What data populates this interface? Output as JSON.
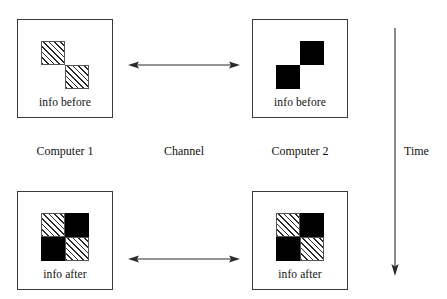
{
  "diagram": {
    "background_color": "#ffffff",
    "line_color": "#3a3a3a",
    "solid_fill_color": "#000000",
    "hatch_fill_color": "#2b2b2b"
  },
  "boxes": [
    {
      "id": "top-left",
      "caption": "info before",
      "cells": {
        "tl": "hatch",
        "tr": "empty",
        "bl": "empty",
        "br": "hatch"
      }
    },
    {
      "id": "top-right",
      "caption": "info before",
      "cells": {
        "tl": "empty",
        "tr": "solid",
        "bl": "solid",
        "br": "empty"
      }
    },
    {
      "id": "bottom-left",
      "caption": "info after",
      "cells": {
        "tl": "hatch",
        "tr": "solid",
        "bl": "solid",
        "br": "hatch"
      }
    },
    {
      "id": "bottom-right",
      "caption": "info after",
      "cells": {
        "tl": "hatch",
        "tr": "solid",
        "bl": "solid",
        "br": "hatch"
      }
    }
  ],
  "arrows": {
    "channel_top": {
      "direction": "bidirectional",
      "orientation": "horizontal"
    },
    "channel_bottom": {
      "direction": "bidirectional",
      "orientation": "horizontal"
    },
    "time": {
      "direction": "down",
      "orientation": "vertical"
    }
  },
  "labels": {
    "computer_1": "Computer 1",
    "channel": "Channel",
    "computer_2": "Computer 2",
    "time": "Time"
  }
}
